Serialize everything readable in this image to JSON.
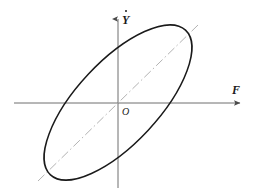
{
  "figure": {
    "type": "analytic-diagram",
    "background_color": "#ffffff",
    "labels": {
      "x_axis": "F",
      "y_axis": "Y",
      "y_axis_accent": "dot-overdot",
      "y_axis_full": "Ẏ",
      "origin": "O"
    },
    "colors": {
      "axis": "#6e6e6e",
      "curve": "#1a1a1a",
      "diagonal": "#b3b3b3",
      "text": "#1a1a1a"
    }
  },
  "chart_data": {
    "type": "scatter",
    "title": "",
    "xlabel": "F",
    "ylabel": "Ẏ",
    "grid": false,
    "legend": null,
    "xlim": [
      -1.35,
      1.35
    ],
    "ylim": [
      -1.35,
      1.35
    ],
    "annotations": [
      {
        "text": "O",
        "x": 0.08,
        "y": -0.12,
        "note": "origin marker label"
      },
      {
        "text": "F",
        "x": 1.28,
        "y": 0.16,
        "note": "horizontal axis name"
      },
      {
        "text": "Ẏ",
        "x": 0.08,
        "y": 1.28,
        "note": "vertical axis name"
      }
    ],
    "series": [
      {
        "name": "hysteresis-loop",
        "shape": "ellipse",
        "style": "solid",
        "color": "#1a1a1a",
        "center": [
          0,
          0
        ],
        "semi_major": 1.18,
        "semi_minor": 0.48,
        "rotation_deg": 47,
        "bbox_px": {
          "left": 46,
          "top": 28,
          "right": 190,
          "bottom": 177
        }
      },
      {
        "name": "major-axis-line",
        "shape": "line",
        "style": "dash-dot",
        "color": "#b3b3b3",
        "slope_deg": 47,
        "from": [
          -1.22,
          -1.22
        ],
        "to": [
          1.22,
          1.22
        ]
      }
    ],
    "axes": [
      {
        "name": "x",
        "from_px": [
          14,
          103
        ],
        "to_px": [
          244,
          103
        ],
        "arrow": "end"
      },
      {
        "name": "y",
        "from_px": [
          118,
          188
        ],
        "to_px": [
          118,
          15
        ],
        "arrow": "end"
      }
    ]
  }
}
